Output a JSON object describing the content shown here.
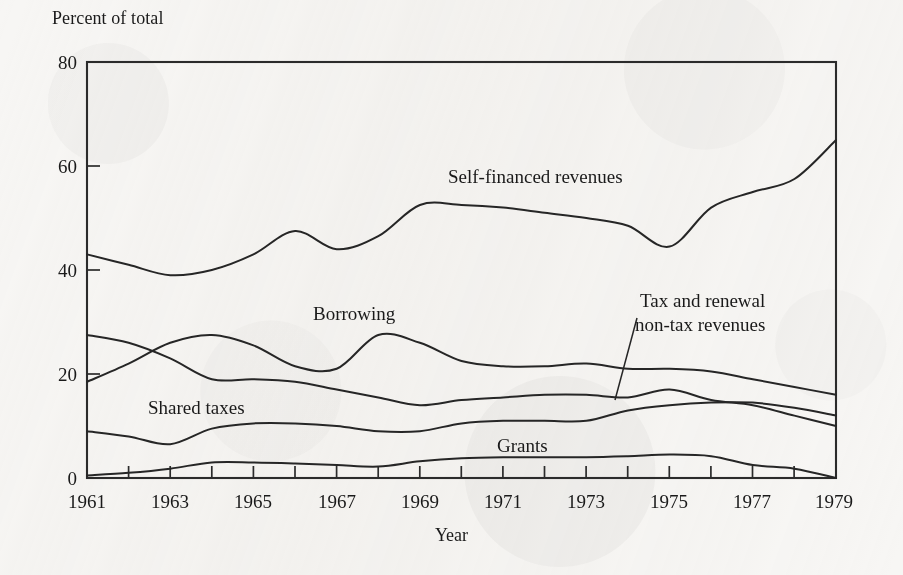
{
  "chart_data": {
    "type": "line",
    "title": "",
    "ylabel": "Percent of total",
    "xlabel": "Year",
    "ylim": [
      0,
      80
    ],
    "xlim": [
      1961,
      1979
    ],
    "yticks": [
      0,
      20,
      40,
      60,
      80
    ],
    "xticks": [
      1961,
      1962,
      1963,
      1964,
      1965,
      1966,
      1967,
      1968,
      1969,
      1970,
      1971,
      1972,
      1973,
      1974,
      1975,
      1976,
      1977,
      1978,
      1979
    ],
    "xtick_labels": [
      "1961",
      "",
      "1963",
      "",
      "1965",
      "",
      "1967",
      "",
      "1969",
      "",
      "1971",
      "",
      "1973",
      "",
      "1975",
      "",
      "1977",
      "",
      "1979"
    ],
    "grid": false,
    "legend_position": "inline-annotations",
    "x": [
      1961,
      1962,
      1963,
      1964,
      1965,
      1966,
      1967,
      1968,
      1969,
      1970,
      1971,
      1972,
      1973,
      1974,
      1975,
      1976,
      1977,
      1978,
      1979
    ],
    "series": [
      {
        "name": "Self-financed revenues",
        "values": [
          43.0,
          41.0,
          39.0,
          40.0,
          43.0,
          47.5,
          44.0,
          46.5,
          52.5,
          52.5,
          52.0,
          51.0,
          50.0,
          48.5,
          44.5,
          52.0,
          55.0,
          57.5,
          65.0
        ]
      },
      {
        "name": "Borrowing",
        "values": [
          18.5,
          22.0,
          26.0,
          27.5,
          25.5,
          21.5,
          21.0,
          27.5,
          26.0,
          22.5,
          21.5,
          21.5,
          22.0,
          21.0,
          21.0,
          20.5,
          19.0,
          17.5,
          16.0
        ]
      },
      {
        "name": "Shared taxes",
        "values": [
          27.5,
          26.0,
          23.0,
          19.0,
          19.0,
          18.5,
          17.0,
          15.5,
          14.0,
          15.0,
          15.5,
          16.0,
          16.0,
          15.5,
          17.0,
          15.0,
          14.0,
          12.0,
          10.0
        ]
      },
      {
        "name": "Tax and renewal non-tax revenues",
        "values": [
          9.0,
          8.0,
          6.5,
          9.5,
          10.5,
          10.5,
          10.0,
          9.0,
          9.0,
          10.5,
          11.0,
          11.0,
          11.0,
          13.0,
          14.0,
          14.5,
          14.5,
          13.5,
          12.0
        ]
      },
      {
        "name": "Grants",
        "values": [
          0.5,
          1.0,
          1.8,
          3.0,
          3.0,
          2.8,
          2.5,
          2.2,
          3.2,
          3.8,
          4.0,
          4.0,
          4.0,
          4.2,
          4.5,
          4.2,
          2.5,
          1.8,
          0.0
        ]
      }
    ],
    "annotations": [
      {
        "text": "Self-financed revenues",
        "x": 1969.0,
        "y": 57.0
      },
      {
        "text": "Borrowing",
        "x": 1966.2,
        "y": 32.5
      },
      {
        "text": "Shared taxes",
        "x": 1962.4,
        "y": 13.5
      },
      {
        "text": "Grants",
        "x": 1971.2,
        "y": 6.5
      },
      {
        "text": "Tax and renewal",
        "x": 1973.6,
        "y": 34.5
      },
      {
        "text": "non-tax revenues",
        "x": 1973.6,
        "y": 31.5
      }
    ]
  },
  "axes": {
    "y_title": "Percent of total",
    "x_title": "Year",
    "y_tick_labels": [
      "0",
      "20",
      "40",
      "60",
      "80"
    ],
    "x_tick_labels": [
      "1961",
      "1963",
      "1965",
      "1967",
      "1969",
      "1971",
      "1973",
      "1975",
      "1977",
      "1979"
    ]
  },
  "labels": {
    "self_financed": "Self-financed revenues",
    "borrowing": "Borrowing",
    "shared_taxes": "Shared taxes",
    "grants": "Grants",
    "tax_line1": "Tax and renewal",
    "tax_line2": "non-tax revenues"
  },
  "colors": {
    "ink": "#262626",
    "paper": "#f7f6f4"
  }
}
